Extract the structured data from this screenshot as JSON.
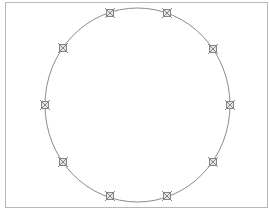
{
  "diagram": {
    "type": "circle-with-markers",
    "frame": {
      "x": 5,
      "y": 2,
      "width": 262,
      "height": 205,
      "stroke": "#b8b8b8"
    },
    "circle": {
      "cx": 137.5,
      "cy": 105,
      "rx": 92.5,
      "ry": 97,
      "stroke": "#8c8c8c",
      "stroke_width": 1
    },
    "marker": {
      "shape": "square-with-x",
      "icon": "x-square-marker-icon",
      "size": 7,
      "stroke": "#7a7a7a"
    },
    "markers": [
      {
        "x": 110,
        "y": 13
      },
      {
        "x": 167,
        "y": 13
      },
      {
        "x": 213,
        "y": 49
      },
      {
        "x": 230,
        "y": 105
      },
      {
        "x": 213,
        "y": 162
      },
      {
        "x": 167,
        "y": 196
      },
      {
        "x": 110,
        "y": 196
      },
      {
        "x": 63,
        "y": 162
      },
      {
        "x": 45,
        "y": 105
      },
      {
        "x": 63,
        "y": 48
      }
    ]
  }
}
